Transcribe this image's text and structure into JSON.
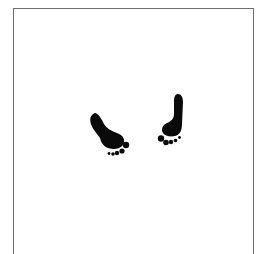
{
  "illustration": {
    "subject": "Two black footprints inside an open-bottom rectangular frame",
    "ink_color": "#0a0a0a",
    "frame_color": "#6e6e6e",
    "background_color": "#ffffff",
    "footprints": [
      {
        "name": "left-footprint",
        "orientation": "slanted, heel upper-left, toes lower-right"
      },
      {
        "name": "right-footprint",
        "orientation": "upright, heel at top, toes at bottom"
      }
    ]
  }
}
